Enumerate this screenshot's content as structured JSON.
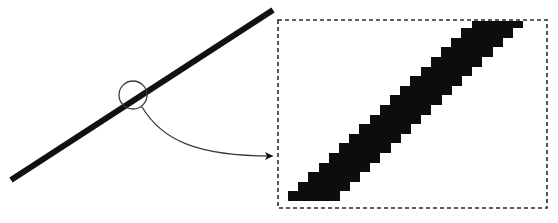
{
  "figure": {
    "name": "line-aliasing-magnification-diagram",
    "canvas": {
      "width": 558,
      "height": 223,
      "background": "#ffffff"
    }
  },
  "colors": {
    "ink": "#0d0d0d",
    "line": "#111111",
    "thin_stroke": "#3a3a3a",
    "dashed_border": "#2b2b2b",
    "background": "#ffffff"
  },
  "source_view": {
    "name": "ideal-line-view",
    "diagonal_line": {
      "label": "thick diagonal line",
      "x1": 11,
      "y1": 180,
      "x2": 273,
      "y2": 10,
      "stroke_width": 6
    },
    "magnifier_ring": {
      "label": "magnifier circle",
      "cx": 133,
      "cy": 95,
      "r": 14,
      "stroke_width": 1.3
    },
    "callout_arrow": {
      "label": "callout arrow",
      "start_x": 142,
      "start_y": 107,
      "c1x": 162,
      "c1y": 140,
      "c2x": 196,
      "c2y": 156,
      "end_x": 272,
      "end_y": 156,
      "stroke_width": 1.3,
      "arrowhead": "solid-triangle"
    }
  },
  "magnified_view": {
    "name": "pixelated-line-inset",
    "frame": {
      "label": "dashed inset border",
      "x": 278,
      "y": 20,
      "width": 269,
      "height": 188,
      "dash": "4 3",
      "stroke_width": 1.6
    },
    "pixel_grid": {
      "label": "aliased staircase band",
      "step_width": 10.2,
      "step_height": 9.6,
      "origin_x": 288,
      "baseline_y": 201,
      "steps": 25,
      "band_thickness_steps": 4
    }
  },
  "chart_data": {
    "type": "line",
    "title": "",
    "xlabel": "",
    "ylabel": "",
    "series": [
      {
        "name": "ideal line",
        "x": [
          11,
          273
        ],
        "y": [
          180,
          10
        ]
      },
      {
        "name": "rasterized staircase",
        "description": "Same line quantized to a pixel grid, drawn as axis-aligned blocks in the inset.",
        "x": [
          288,
          537
        ],
        "y": [
          201,
          28
        ]
      }
    ],
    "grid": false,
    "legend": "none"
  }
}
